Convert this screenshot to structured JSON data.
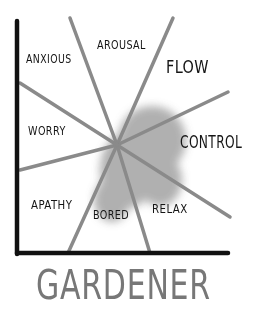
{
  "diagram": {
    "title": "GARDENER",
    "center": {
      "x": 117,
      "y": 145
    },
    "axes": {
      "color": "#111111",
      "y_axis": {
        "x": 17,
        "y1": 20,
        "y2": 255
      },
      "x_axis": {
        "y": 253,
        "x1": 17,
        "x2": 228
      }
    },
    "spoke_color": "#8a8a8a",
    "blob_color": "#9a9a9a",
    "spokes": [
      {
        "x": 70,
        "y": 18
      },
      {
        "x": 173,
        "y": 18
      },
      {
        "x": 228,
        "y": 92
      },
      {
        "x": 230,
        "y": 217
      },
      {
        "x": 150,
        "y": 253
      },
      {
        "x": 68,
        "y": 253
      },
      {
        "x": 20,
        "y": 170
      },
      {
        "x": 20,
        "y": 83
      }
    ],
    "regions": {
      "anxious": "ANXIOUS",
      "arousal": "AROUSAL",
      "flow": "FLOW",
      "worry": "WORRY",
      "control": "CONTROL",
      "apathy": "APATHY",
      "bored": "BORED",
      "relax": "RELAX"
    }
  }
}
